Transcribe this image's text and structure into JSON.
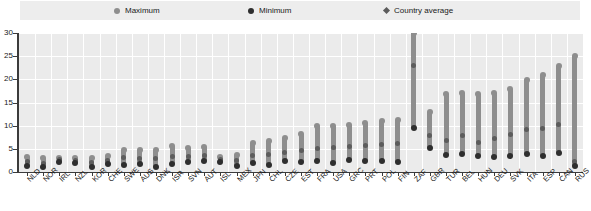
{
  "legend": {
    "items": [
      {
        "label": "Maximum",
        "marker": "circle-gray",
        "color": "#8e8e8e"
      },
      {
        "label": "Minimum",
        "marker": "circle-dark",
        "color": "#2e2e2e"
      },
      {
        "label": "Country average",
        "marker": "diamond-gray",
        "color": "#5c5c5c"
      }
    ],
    "background": "#ededed"
  },
  "chart_data": {
    "type": "bar",
    "title": "",
    "subtitle": "",
    "xlabel": "",
    "ylabel": "",
    "ylim": [
      0,
      30
    ],
    "yticks": [
      0,
      5,
      10,
      15,
      20,
      25,
      30
    ],
    "ytick_labels": [
      "0",
      "5",
      "10",
      "15",
      "20",
      "25",
      "30"
    ],
    "grid": true,
    "legend_position": "top",
    "categories": [
      "NLD",
      "NOR",
      "IRL",
      "NZL",
      "KOR",
      "CHE",
      "SWE",
      "AUS",
      "DNK",
      "ISR",
      "SVN",
      "AUT",
      "ISL",
      "MEX",
      "JPN",
      "CHL",
      "CZE",
      "EST",
      "FRA",
      "USA",
      "GRC",
      "PRT",
      "POL",
      "FIN",
      "ZAF",
      "GBR",
      "TUR",
      "BEL",
      "HUN",
      "DEU",
      "SVK",
      "ITA",
      "ESP",
      "CAN",
      "RUS"
    ],
    "series": [
      {
        "name": "Maximum",
        "color": "#8e8e8e",
        "values": [
          3.2,
          3.0,
          3.0,
          3.1,
          3.0,
          3.4,
          4.8,
          4.7,
          4.7,
          5.6,
          5.2,
          5.5,
          3.3,
          3.7,
          6.2,
          6.6,
          7.4,
          8.3,
          9.9,
          9.9,
          10.1,
          10.6,
          11.0,
          11.3,
          30.0,
          13.0,
          16.8,
          17.1,
          16.9,
          17.0,
          18.0,
          19.9,
          21.0,
          22.8,
          25.1
        ]
      },
      {
        "name": "Minimum",
        "color": "#2e2e2e",
        "values": [
          1.4,
          1.0,
          2.2,
          1.9,
          1.0,
          1.7,
          1.6,
          1.8,
          1.1,
          1.7,
          2.2,
          2.4,
          2.1,
          1.3,
          2.0,
          1.6,
          2.3,
          2.1,
          2.3,
          1.9,
          2.6,
          2.4,
          2.4,
          2.1,
          9.6,
          5.1,
          3.6,
          3.9,
          3.5,
          3.2,
          3.5,
          3.8,
          3.4,
          4.0,
          1.2
        ]
      },
      {
        "name": "Country average",
        "color": "#5c5c5c",
        "values": [
          2.2,
          1.9,
          2.6,
          2.5,
          2.1,
          2.5,
          3.1,
          3.0,
          2.9,
          3.4,
          3.4,
          3.6,
          2.7,
          2.5,
          3.6,
          3.7,
          4.3,
          4.6,
          5.1,
          5.2,
          5.6,
          5.7,
          5.9,
          6.1,
          23.0,
          7.9,
          6.8,
          7.8,
          6.4,
          7.2,
          8.0,
          9.1,
          9.4,
          10.3,
          2.3
        ]
      }
    ]
  }
}
